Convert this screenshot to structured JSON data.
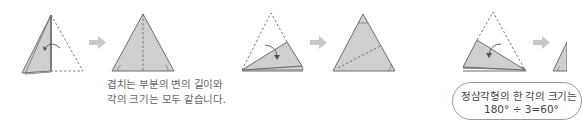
{
  "diagram": {
    "colors": {
      "fill": "#cfcfcf",
      "outline": "#6e6e6e",
      "arrow": "#c8c8c8",
      "text": "#666666"
    },
    "steps": [
      {
        "id": "step1",
        "description": "half-folded triangle, fold right half back along vertical center"
      },
      {
        "id": "step2",
        "description": "triangle with vertical dashed center crease, base angles marked"
      },
      {
        "id": "step3",
        "description": "fold top corner down toward bottom edge"
      },
      {
        "id": "step4",
        "description": "triangle with diagonal dashed crease, top and bottom-right angles marked"
      },
      {
        "id": "step5",
        "description": "fold top corner down again"
      },
      {
        "id": "step6",
        "description": "triangle partially visible at right edge"
      }
    ],
    "arrows": [
      "next-arrow-1",
      "next-arrow-2",
      "next-arrow-3"
    ],
    "caption": {
      "line1": "겹치는 부분의 변의 길이와",
      "line2": "각의 크기는 모두 같습니다."
    },
    "bubble": {
      "line1": "정삼각형의 한 각의 크기는",
      "line2": "180° ÷ 3=60°"
    }
  }
}
